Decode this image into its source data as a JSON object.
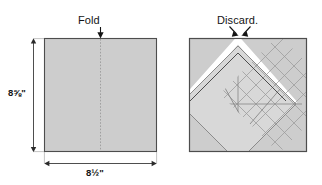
{
  "figure": {
    "title": "",
    "panels": [
      {
        "id": "left",
        "name": "folded-square-panel",
        "caption": "Fold",
        "caption_icon": "down-arrow-icon",
        "dim_height": "8⅝\"",
        "dim_width": "8½\"",
        "fold_line": "vertical-dotted-center-line",
        "shape": "square"
      },
      {
        "id": "right",
        "name": "diamond-grid-panel",
        "caption": "Discard.",
        "caption_icon": "double-arrow-down-icon",
        "shape": "square-with-rotated-grid-diamond",
        "grid_divisions": 6
      }
    ]
  },
  "colors": {
    "fabric_fill": "#cdcdcd",
    "fabric_stroke": "#4d4d4d",
    "grid_line": "#9a9a9a",
    "diamond_fill": "#d8d8d8",
    "paper": "#ffffff",
    "ink": "#141414",
    "dim_line": "#3a3a3a"
  },
  "geometry": {
    "left_square": {
      "x": 44,
      "y": 38,
      "w": 113,
      "h": 114
    },
    "right_square": {
      "x": 189,
      "y": 38,
      "w": 118,
      "h": 114
    },
    "vdim_x": 33,
    "hdim_y": 163
  }
}
